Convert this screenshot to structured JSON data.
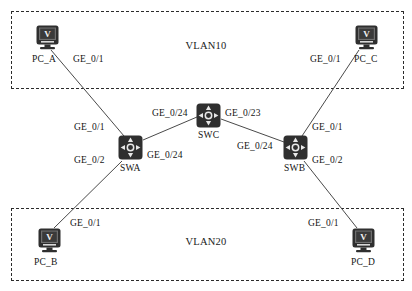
{
  "diagram": {
    "width": 412,
    "height": 291,
    "colors": {
      "background": "#ffffff",
      "device_body": "#2f2f2f",
      "device_glyph": "#e8e8e8",
      "link": "#4a4a4a",
      "zone_border": "#2b2b2b",
      "text": "#141414"
    }
  },
  "zones": [
    {
      "id": "vlan10",
      "label": "VLAN10"
    },
    {
      "id": "vlan20",
      "label": "VLAN20"
    }
  ],
  "devices": [
    {
      "id": "pc_a",
      "label": "PC_A",
      "type": "pc",
      "screen_glyph": "V"
    },
    {
      "id": "pc_b",
      "label": "PC_B",
      "type": "pc",
      "screen_glyph": "V"
    },
    {
      "id": "pc_c",
      "label": "PC_C",
      "type": "pc",
      "screen_glyph": "V"
    },
    {
      "id": "pc_d",
      "label": "PC_D",
      "type": "pc",
      "screen_glyph": "V"
    },
    {
      "id": "swa",
      "label": "SWA",
      "type": "switch"
    },
    {
      "id": "swb",
      "label": "SWB",
      "type": "switch"
    },
    {
      "id": "swc",
      "label": "SWC",
      "type": "switch"
    }
  ],
  "links": [
    {
      "id": "pc_a-swa",
      "from": "pc_a",
      "to": "swa",
      "from_port": "GE_0/1",
      "to_port": "GE_0/1"
    },
    {
      "id": "pc_b-swa",
      "from": "pc_b",
      "to": "swa",
      "from_port": "GE_0/1",
      "to_port": "GE_0/2"
    },
    {
      "id": "swa-swc",
      "from": "swa",
      "to": "swc",
      "from_port": "GE_0/24",
      "to_port": "GE_0/24"
    },
    {
      "id": "swc-swb",
      "from": "swc",
      "to": "swb",
      "from_port": "GE_0/23",
      "to_port": "GE_0/24"
    },
    {
      "id": "pc_c-swb",
      "from": "pc_c",
      "to": "swb",
      "from_port": "GE_0/1",
      "to_port": "GE_0/1"
    },
    {
      "id": "pc_d-swb",
      "from": "pc_d",
      "to": "swb",
      "from_port": "GE_0/1",
      "to_port": "GE_0/2"
    }
  ],
  "port_labels": {
    "pc_a_side": "GE_0/1",
    "swa_top": "GE_0/1",
    "swa_bottom": "GE_0/2",
    "swa_right": "GE_0/24",
    "swc_left": "GE_0/24",
    "swc_right": "GE_0/23",
    "swb_left": "GE_0/24",
    "swb_top": "GE_0/1",
    "swb_bottom": "GE_0/2",
    "pc_b_side": "GE_0/1",
    "pc_c_side": "GE_0/1",
    "pc_d_side": "GE_0/1"
  }
}
